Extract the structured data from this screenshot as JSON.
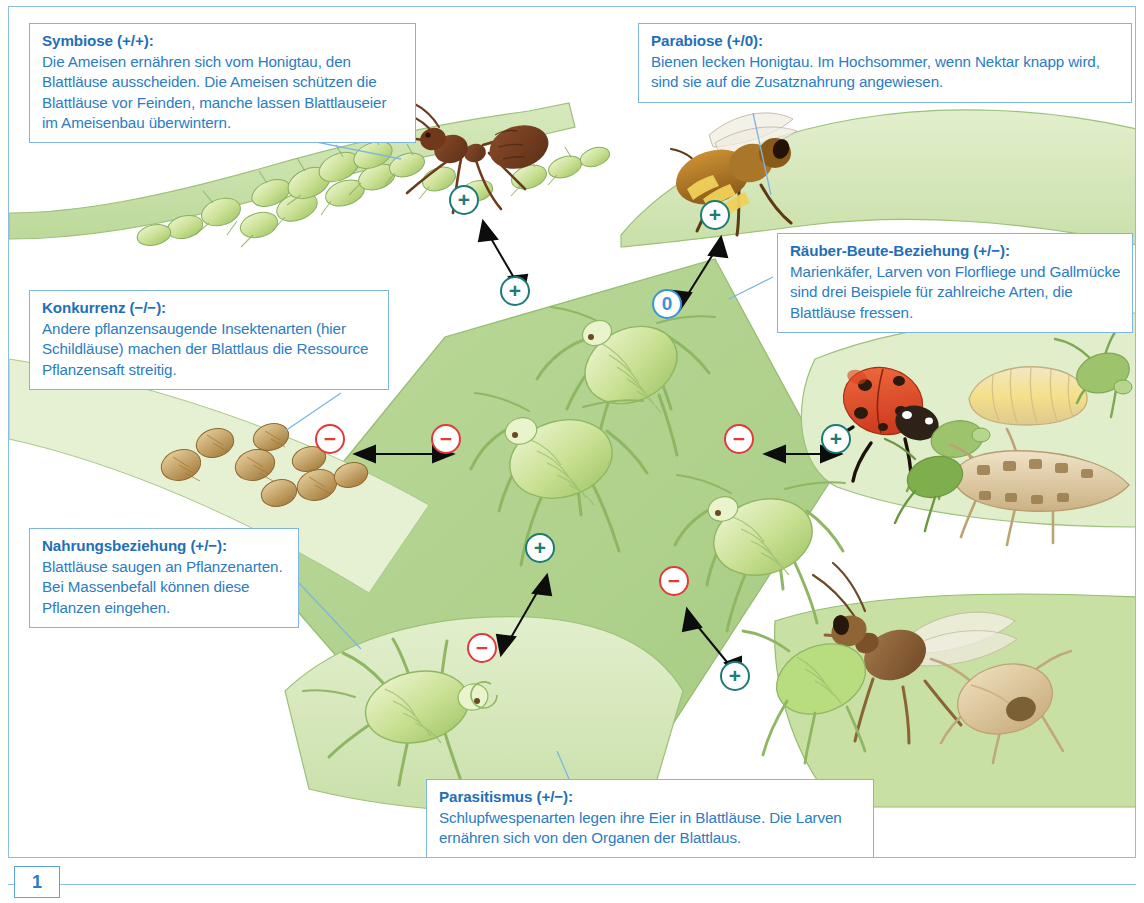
{
  "figure": {
    "page_number": "1",
    "callouts": [
      {
        "id": "symbiose",
        "title": "Symbiose",
        "sign": "(+/+):",
        "body": "Die Ameisen ernähren sich vom Honigtau, den Blattläuse ausscheiden. Die Ameisen schützen die Blattläuse vor Feinden, manche lassen Blattlauseier im Ameisenbau überwintern."
      },
      {
        "id": "parabiose",
        "title": "Parabiose",
        "sign": "(+/0):",
        "body": "Bienen lecken Honigtau. Im Hochsommer, wenn Nektar knapp wird, sind sie auf die Zusatznahrung angewiesen."
      },
      {
        "id": "raeuber",
        "title": "Räuber-Beute-Beziehung",
        "sign": "(+/−):",
        "body": "Marienkäfer, Larven von Florfliege und Gallmücke sind drei Beispiele für zahlreiche Arten, die Blattläuse fressen."
      },
      {
        "id": "konkurrenz",
        "title": "Konkurrenz",
        "sign": "(−/−):",
        "body": "Andere pflanzensaugende Insektenarten (hier Schildläuse) machen der Blattlaus die Ressource Pflanzensaft streitig."
      },
      {
        "id": "nahrung",
        "title": "Nahrungsbeziehung",
        "sign": "(+/−):",
        "body": "Blattläuse saugen an Pflanzenarten. Bei Massenbefall können diese Pflanzen eingehen."
      },
      {
        "id": "parasit",
        "title": "Parasitismus",
        "sign": "(+/−):",
        "body": "Schlupfwespenarten legen ihre Eier in Blattläuse. Die Larven ernähren sich von den Organen der Blattlaus."
      }
    ],
    "badges": [
      {
        "id": "symbiose-ant",
        "symbol": "+",
        "kind": "plus",
        "x": 455,
        "y": 193
      },
      {
        "id": "symbiose-aphid",
        "symbol": "+",
        "kind": "plus",
        "x": 506,
        "y": 284
      },
      {
        "id": "parabiose-bee",
        "symbol": "+",
        "kind": "plus",
        "x": 706,
        "y": 208
      },
      {
        "id": "parabiose-aphid",
        "symbol": "0",
        "kind": "zero",
        "x": 658,
        "y": 297
      },
      {
        "id": "konkurrenz-scale",
        "symbol": "−",
        "kind": "minus",
        "x": 321,
        "y": 432
      },
      {
        "id": "konkurrenz-aphid",
        "symbol": "−",
        "kind": "minus",
        "x": 437,
        "y": 432
      },
      {
        "id": "raeuber-aphid",
        "symbol": "−",
        "kind": "minus",
        "x": 730,
        "y": 432
      },
      {
        "id": "raeuber-predator",
        "symbol": "+",
        "kind": "plus",
        "x": 827,
        "y": 432
      },
      {
        "id": "nahrung-aphid",
        "symbol": "+",
        "kind": "plus",
        "x": 531,
        "y": 541
      },
      {
        "id": "nahrung-plant",
        "symbol": "−",
        "kind": "minus",
        "x": 473,
        "y": 641
      },
      {
        "id": "parasit-aphid",
        "symbol": "−",
        "kind": "minus",
        "x": 665,
        "y": 574
      },
      {
        "id": "parasit-wasp",
        "symbol": "+",
        "kind": "plus",
        "x": 726,
        "y": 669
      }
    ],
    "colors": {
      "callout_text": "#2b7cc4",
      "callout_border": "#7fb6dd",
      "plus": "#1c7b74",
      "minus": "#e03a3a",
      "zero": "#3a93d8",
      "leaf_light": "#d8e8bd",
      "leaf_mid": "#aed18a",
      "ant": "#8a4b2a",
      "ladybird": "#e24a28"
    },
    "organisms": [
      {
        "name": "ant",
        "label": "Ameise"
      },
      {
        "name": "aphid-colony",
        "label": "Blattlauskolonie"
      },
      {
        "name": "honeybee",
        "label": "Biene"
      },
      {
        "name": "scale-insects",
        "label": "Schildläuse"
      },
      {
        "name": "aphid-large",
        "label": "Blattlaus"
      },
      {
        "name": "ladybird",
        "label": "Marienkäfer"
      },
      {
        "name": "gall-midge-larva",
        "label": "Gallmückenlarve"
      },
      {
        "name": "lacewing-larva",
        "label": "Florfliegenlarve"
      },
      {
        "name": "parasitoid-wasp",
        "label": "Schlupfwespe"
      },
      {
        "name": "aphid-mummy",
        "label": "Blattlausmumie"
      }
    ]
  }
}
